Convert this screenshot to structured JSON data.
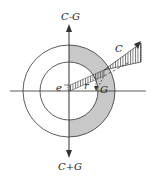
{
  "diagram": {
    "labels": {
      "top_arrow": "C-G",
      "bottom_arrow": "C+G",
      "force": "C",
      "eccentricity": "e",
      "radius": "r",
      "gravity": "G"
    },
    "colors": {
      "line": "#333333",
      "ring_fill": "#c8c8c8",
      "background": "#ffffff"
    }
  }
}
